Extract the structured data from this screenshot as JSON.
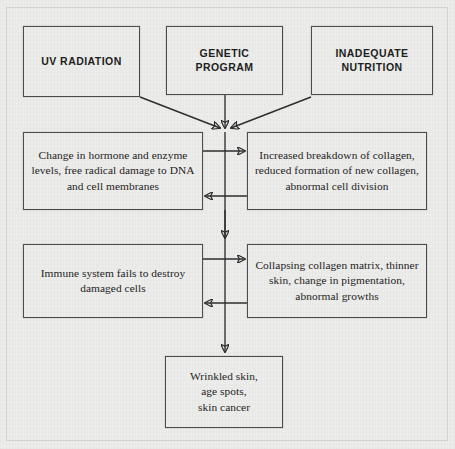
{
  "diagram": {
    "type": "flowchart",
    "nodes": [
      {
        "id": "uv",
        "label": "UV RADIATION",
        "style": "caps",
        "row": 1,
        "col": 1
      },
      {
        "id": "genetic",
        "label": "GENETIC\nPROGRAM",
        "style": "caps",
        "row": 1,
        "col": 2
      },
      {
        "id": "nutrition",
        "label": "INADEQUATE\nNUTRITION",
        "style": "caps",
        "row": 1,
        "col": 3
      },
      {
        "id": "hormone",
        "label": "Change in hormone and enzyme levels, free radical damage to DNA and cell membranes",
        "style": "body",
        "row": 2,
        "col": 1
      },
      {
        "id": "collagen",
        "label": "Increased breakdown of collagen, reduced formation of new collagen, abnormal cell division",
        "style": "body",
        "row": 2,
        "col": 2
      },
      {
        "id": "immune",
        "label": "Immune system fails to destroy damaged cells",
        "style": "body",
        "row": 3,
        "col": 1
      },
      {
        "id": "matrix",
        "label": "Collapsing collagen matrix, thinner skin, change in pigmentation, abnormal growths",
        "style": "body",
        "row": 3,
        "col": 2
      },
      {
        "id": "outcome",
        "label": "Wrinkled skin,\nage spots,\nskin cancer",
        "style": "body",
        "row": 4,
        "col": 1
      }
    ],
    "edges": [
      {
        "from": "uv",
        "to": "junction-1",
        "kind": "diagonal-arrow"
      },
      {
        "from": "genetic",
        "to": "junction-1",
        "kind": "vertical-arrow"
      },
      {
        "from": "nutrition",
        "to": "junction-1",
        "kind": "diagonal-arrow"
      },
      {
        "from": "hormone",
        "to": "collagen",
        "kind": "horizontal-arrow-right"
      },
      {
        "from": "collagen",
        "to": "hormone",
        "kind": "horizontal-arrow-left"
      },
      {
        "from": "junction-1",
        "to": "junction-2",
        "kind": "vertical-arrow"
      },
      {
        "from": "immune",
        "to": "matrix",
        "kind": "horizontal-arrow-right"
      },
      {
        "from": "matrix",
        "to": "immune",
        "kind": "horizontal-arrow-left"
      },
      {
        "from": "junction-2",
        "to": "outcome",
        "kind": "vertical-arrow"
      }
    ],
    "colors": {
      "background": "#ececea",
      "node_border": "#4a4a4a",
      "node_fill": "#ececea",
      "line": "#2b2b2b",
      "text": "#1b1b1b",
      "frame": "#d3d3d1"
    }
  }
}
